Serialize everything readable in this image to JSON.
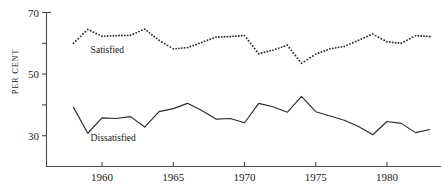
{
  "chart_data": {
    "type": "line",
    "title": "",
    "subtitle": "",
    "xlabel": "",
    "ylabel": "PER CENT",
    "xlim": [
      1957.2,
      1983.6
    ],
    "ylim": [
      20,
      70
    ],
    "grid": false,
    "legend_position": "inline-annotation",
    "x_ticks": [
      1960,
      1965,
      1970,
      1975,
      1980
    ],
    "x_tick_labels": [
      "1960",
      "1965",
      "1970",
      "1975",
      "1980"
    ],
    "y_ticks": [
      30,
      40,
      50,
      60,
      70
    ],
    "y_tick_labels": [
      "30",
      "",
      "50",
      "",
      "70"
    ],
    "y_labeled_ticks": [
      30,
      50,
      70
    ],
    "series": [
      {
        "name": "Satisfied",
        "style": "dotted",
        "marker": "dot",
        "color": "#2b2b2b",
        "x": [
          1958,
          1959,
          1960,
          1961,
          1962,
          1963,
          1964,
          1965,
          1966,
          1967,
          1968,
          1969,
          1970,
          1971,
          1972,
          1973,
          1974,
          1975,
          1976,
          1977,
          1978,
          1979,
          1980,
          1981,
          1982,
          1983
        ],
        "values": [
          60.0,
          64.5,
          62.3,
          62.5,
          62.6,
          64.6,
          61.0,
          58.2,
          58.6,
          60.3,
          62.0,
          62.2,
          62.5,
          56.6,
          57.8,
          59.4,
          53.5,
          56.5,
          58.2,
          59.0,
          61.0,
          63.0,
          60.5,
          60.0,
          62.5,
          62.2
        ]
      },
      {
        "name": "Dissatisfied",
        "style": "solid",
        "marker": "none",
        "color": "#2b2b2b",
        "x": [
          1958,
          1959,
          1960,
          1961,
          1962,
          1963,
          1964,
          1965,
          1966,
          1967,
          1968,
          1969,
          1970,
          1971,
          1972,
          1973,
          1974,
          1975,
          1976,
          1977,
          1978,
          1979,
          1980,
          1981,
          1982,
          1983
        ],
        "values": [
          39.2,
          30.8,
          35.8,
          35.6,
          36.2,
          32.8,
          37.8,
          38.8,
          40.5,
          38.2,
          35.4,
          35.6,
          34.2,
          40.5,
          39.4,
          37.6,
          42.8,
          37.8,
          36.4,
          35.0,
          33.0,
          30.3,
          34.6,
          34.0,
          31.0,
          32.0
        ]
      }
    ],
    "annotations": [
      {
        "name": "satisfied-label",
        "text": "Satisfied",
        "x": 1959.2,
        "y": 57.0
      },
      {
        "name": "dissatisfied-label",
        "text": "Dissatisfied",
        "x": 1959.2,
        "y": 28.2
      }
    ]
  }
}
